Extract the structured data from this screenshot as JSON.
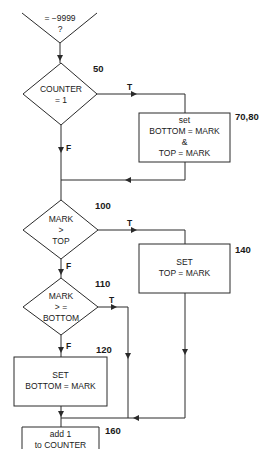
{
  "flowchart": {
    "start_decision": {
      "line1": "= −9999",
      "line2": "?"
    },
    "decision_50": {
      "number": "50",
      "line1": "COUNTER",
      "line2": "= 1",
      "true_label": "T",
      "false_label": "F"
    },
    "process_70_80": {
      "number": "70,80",
      "line1": "set",
      "line2": "BOTTOM = MARK",
      "line3": "&",
      "line4": "TOP = MARK"
    },
    "decision_100": {
      "number": "100",
      "line1": "MARK",
      "line2": ">",
      "line3": "TOP",
      "true_label": "T",
      "false_label": "F"
    },
    "process_140": {
      "number": "140",
      "line1": "SET",
      "line2": "TOP = MARK"
    },
    "decision_110": {
      "number": "110",
      "line1": "MARK",
      "line2": "> =",
      "line3": "BOTTOM",
      "true_label": "T",
      "false_label": "F"
    },
    "process_120": {
      "number": "120",
      "line1": "SET",
      "line2": "BOTTOM = MARK"
    },
    "process_160": {
      "number": "160",
      "line1": "add 1",
      "line2": "to COUNTER"
    }
  },
  "colors": {
    "line": "#2a2a2a",
    "background": "#ffffff"
  }
}
